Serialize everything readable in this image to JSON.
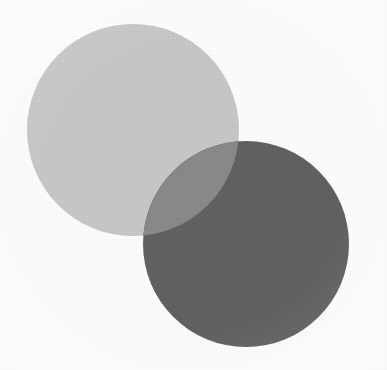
{
  "figure": {
    "width": 387,
    "height": 370,
    "background_color": "#ffffff",
    "blend_mode": "multiply",
    "texture": "halftone-scan-grain"
  },
  "chart_data": {
    "type": "venn",
    "xlabel": "",
    "ylabel": "",
    "grid": false,
    "legend_position": "none",
    "background_color": "#ffffff",
    "sets": [
      {
        "name": "set-a",
        "label": "",
        "cx": 133,
        "cy": 130,
        "r": 106,
        "fill": "#c9c9c9",
        "opacity": 1
      },
      {
        "name": "set-b",
        "label": "",
        "cx": 246,
        "cy": 244,
        "r": 103,
        "fill": "#626262",
        "opacity": 1
      }
    ],
    "intersection": {
      "name": "set-a-and-set-b",
      "label": "",
      "fill": "#8a8a8a",
      "tip_upper": [
        228,
        150
      ],
      "tip_lower": [
        152,
        228
      ]
    },
    "annotations": []
  }
}
